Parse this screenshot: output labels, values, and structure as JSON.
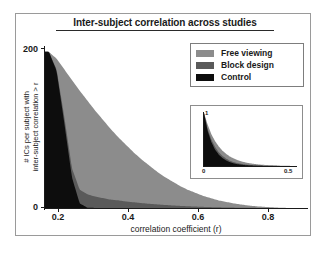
{
  "figure": {
    "title": "Inter-subject correlation across studies"
  },
  "legend": {
    "position": "top-right",
    "items": [
      {
        "label": "Free viewing",
        "color": "#8c8c8c",
        "key": "free_viewing"
      },
      {
        "label": "Block design",
        "color": "#5a5a5a",
        "key": "block_design"
      },
      {
        "label": "Control",
        "color": "#0d0d0d",
        "key": "control"
      }
    ]
  },
  "chart_data": {
    "type": "area",
    "title": "Inter-subject correlation across studies",
    "xlabel": "correlation coefficient (r)",
    "ylabel": "# ICs per subject with inter-subject correlation > r",
    "ylabel_line1": "# ICs per subject with",
    "ylabel_line2": "inter-subject correlation > r",
    "xlim": [
      0.17,
      0.85
    ],
    "ylim": [
      0,
      210
    ],
    "xticks": [
      0.2,
      0.4,
      0.6,
      0.8
    ],
    "xticklabels": [
      "0.2",
      "0.4",
      "0.6",
      "0.8"
    ],
    "yticks": [
      0,
      200
    ],
    "yticklabels": [
      "0",
      "200"
    ],
    "grid": false,
    "stacking": "overlaid",
    "x": [
      0.18,
      0.2,
      0.22,
      0.24,
      0.26,
      0.28,
      0.3,
      0.32,
      0.34,
      0.36,
      0.38,
      0.4,
      0.42,
      0.44,
      0.46,
      0.48,
      0.5,
      0.52,
      0.54,
      0.56,
      0.58,
      0.6,
      0.62,
      0.64,
      0.66,
      0.68,
      0.7,
      0.72,
      0.74,
      0.76,
      0.78,
      0.8
    ],
    "series": [
      {
        "name": "Free viewing",
        "color": "#8c8c8c",
        "values": [
          205,
          196,
          182,
          168,
          154,
          141,
          128,
          116,
          104,
          93,
          83,
          73,
          64,
          56,
          48,
          41,
          35,
          29,
          24,
          20,
          16,
          13,
          10,
          8,
          6,
          4.5,
          3.2,
          2.2,
          1.5,
          0.9,
          0.4,
          0.1
        ]
      },
      {
        "name": "Block design",
        "color": "#5a5a5a",
        "values": [
          205,
          182,
          120,
          52,
          24,
          18,
          15,
          13,
          11,
          10,
          8.5,
          7.5,
          6.5,
          5.5,
          4.8,
          4.0,
          3.4,
          2.8,
          2.3,
          1.9,
          1.5,
          1.2,
          0.9,
          0.7,
          0.5,
          0.35,
          0.25,
          0.15,
          0.1,
          0.05,
          0.02,
          0.0
        ]
      },
      {
        "name": "Control",
        "color": "#0d0d0d",
        "values": [
          205,
          180,
          112,
          40,
          6,
          0.5,
          0.1,
          0,
          0,
          0,
          0,
          0,
          0,
          0,
          0,
          0,
          0,
          0,
          0,
          0,
          0,
          0,
          0,
          0,
          0,
          0,
          0,
          0,
          0,
          0,
          0,
          0
        ]
      }
    ]
  },
  "inset": {
    "type": "area",
    "xlim": [
      0,
      0.5
    ],
    "ylim": [
      0,
      1
    ],
    "xticks": [
      0,
      0.5
    ],
    "xticklabels": [
      "0",
      "0.5"
    ],
    "yticks": [
      1
    ],
    "yticklabels": [
      "1"
    ],
    "x": [
      0.0,
      0.02,
      0.04,
      0.06,
      0.08,
      0.1,
      0.12,
      0.14,
      0.16,
      0.18,
      0.2,
      0.22,
      0.24,
      0.26,
      0.28,
      0.3,
      0.34,
      0.38,
      0.42,
      0.46,
      0.5
    ],
    "series": [
      {
        "name": "Free viewing",
        "color": "#8c8c8c",
        "values": [
          1.0,
          0.78,
          0.6,
          0.47,
          0.37,
          0.29,
          0.23,
          0.18,
          0.145,
          0.115,
          0.09,
          0.072,
          0.057,
          0.045,
          0.036,
          0.028,
          0.018,
          0.011,
          0.006,
          0.003,
          0.0
        ]
      },
      {
        "name": "Block design",
        "color": "#5a5a5a",
        "values": [
          1.0,
          0.7,
          0.5,
          0.36,
          0.26,
          0.19,
          0.14,
          0.1,
          0.075,
          0.056,
          0.042,
          0.031,
          0.023,
          0.017,
          0.013,
          0.009,
          0.005,
          0.003,
          0.0015,
          0.0005,
          0.0
        ]
      },
      {
        "name": "Control",
        "color": "#0d0d0d",
        "values": [
          1.0,
          0.66,
          0.45,
          0.31,
          0.215,
          0.15,
          0.105,
          0.073,
          0.051,
          0.036,
          0.025,
          0.017,
          0.012,
          0.008,
          0.005,
          0.003,
          0.0015,
          0.0005,
          0.0,
          0.0,
          0.0
        ]
      }
    ]
  }
}
